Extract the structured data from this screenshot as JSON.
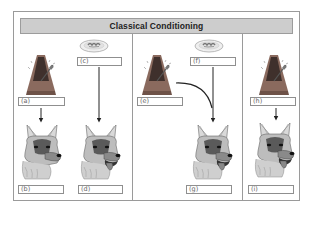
{
  "title": "Classical Conditioning",
  "panels": [
    {
      "id": "before",
      "items": [
        {
          "icon": "metronome-icon",
          "label": "(a)"
        },
        {
          "icon": "dog-icon",
          "label": "(b)",
          "mouth": "closed"
        },
        {
          "icon": "food-bowl-icon",
          "label": "(c)"
        },
        {
          "icon": "dog-icon",
          "label": "(d)",
          "mouth": "open-salivating"
        }
      ]
    },
    {
      "id": "during",
      "items": [
        {
          "icon": "metronome-icon",
          "label": "(e)"
        },
        {
          "icon": "food-bowl-icon",
          "label": "(f)"
        },
        {
          "icon": "dog-icon",
          "label": "(g)",
          "mouth": "open-salivating"
        }
      ]
    },
    {
      "id": "after",
      "items": [
        {
          "icon": "metronome-icon",
          "label": "(h)"
        },
        {
          "icon": "dog-icon",
          "label": "(i)",
          "mouth": "open-salivating"
        }
      ]
    }
  ],
  "colors": {
    "frame_border": "#9a9a9a",
    "title_fill": "#cdcdcd",
    "arrow": "#222222",
    "metronome_body": "#8a6a5e",
    "metronome_shade": "#4a3a36"
  }
}
